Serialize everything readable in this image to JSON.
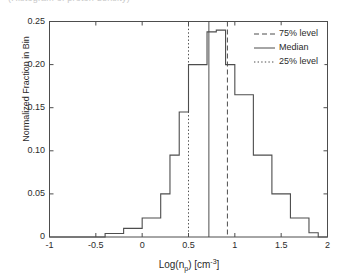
{
  "figure": {
    "cropped_top_text": "(Histogram of proton density)"
  },
  "chart_data": {
    "type": "bar",
    "title": "",
    "subtitle": "",
    "xlabel": "Log(n_p) [cm^-3]",
    "xlabel_parts": {
      "pre": "Log(n",
      "sub": "p",
      "mid": ") [cm",
      "sup": "-3",
      "post": "]"
    },
    "ylabel": "Normalized Fraction in Bin",
    "xlim": [
      -1,
      2
    ],
    "ylim": [
      0,
      0.25
    ],
    "grid": false,
    "xticks": [
      -1,
      -0.5,
      0,
      0.5,
      1,
      1.5,
      2
    ],
    "xtick_labels": [
      "-1",
      "-0.5",
      "0",
      "0.5",
      "1",
      "1.5",
      "2"
    ],
    "yticks": [
      0,
      0.05,
      0.1,
      0.15,
      0.2,
      0.25
    ],
    "ytick_labels": [
      "0",
      "0.05",
      "0.10",
      "0.15",
      "0.20",
      "0.25"
    ],
    "bin_width": 0.1,
    "bin_edges": [
      -1.0,
      -0.9,
      -0.8,
      -0.7,
      -0.6,
      -0.5,
      -0.4,
      -0.3,
      -0.2,
      -0.1,
      0.0,
      0.1,
      0.2,
      0.3,
      0.4,
      0.5,
      0.6,
      0.7,
      0.8,
      0.9,
      1.0,
      1.1,
      1.2,
      1.3,
      1.4,
      1.5,
      1.6,
      1.7,
      1.8,
      1.9,
      2.0
    ],
    "values": [
      0.0,
      0.0,
      0.0,
      0.0,
      0.0,
      0.0,
      0.004,
      0.004,
      0.01,
      0.01,
      0.022,
      0.022,
      0.05,
      0.095,
      0.145,
      0.2,
      0.2,
      0.238,
      0.24,
      0.2,
      0.165,
      0.165,
      0.095,
      0.095,
      0.05,
      0.05,
      0.022,
      0.022,
      0.005,
      0.0
    ],
    "annotations": [
      {
        "name": "25% level",
        "x": 0.5,
        "style": "dotted"
      },
      {
        "name": "Median",
        "x": 0.72,
        "style": "solid"
      },
      {
        "name": "75% level",
        "x": 0.92,
        "style": "dashed"
      }
    ],
    "legend": {
      "position": "upper right",
      "entries": [
        {
          "label": "75% level",
          "style": "dashed"
        },
        {
          "label": "Median",
          "style": "solid"
        },
        {
          "label": "25% level",
          "style": "dotted"
        }
      ]
    },
    "line_color": "#4d4d4d"
  }
}
